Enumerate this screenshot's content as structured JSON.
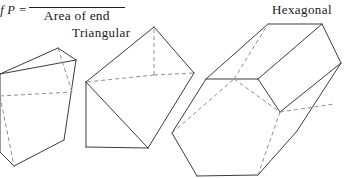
{
  "figure": {
    "background_color": "#ffffff",
    "line_color": "#3c3c3c",
    "hidden_line_color": "#8e8e8e",
    "text_color": "#1a1a1a",
    "width": 349,
    "height": 178
  },
  "formula": {
    "lhs": "h of P =",
    "numerator": "",
    "denominator": "Area of end"
  },
  "labels": {
    "triangular": "Triangular",
    "hexagonal": "Hexagonal"
  },
  "shapes": [
    {
      "name": "triangular-prism-left",
      "label": "",
      "cross_section": "triangle",
      "visible_edges": [
        [
          0,
          152,
          14,
          166
        ],
        [
          14,
          166,
          64,
          140
        ],
        [
          0,
          74,
          58,
          48
        ],
        [
          58,
          48,
          76,
          60
        ],
        [
          76,
          60,
          64,
          140
        ],
        [
          0,
          152,
          0,
          74
        ],
        [
          0,
          74,
          76,
          60
        ]
      ],
      "hidden_edges": [
        [
          0,
          96,
          72,
          92
        ],
        [
          72,
          92,
          58,
          48
        ],
        [
          0,
          96,
          14,
          166
        ]
      ]
    },
    {
      "name": "triangular-prism-middle",
      "label": "Triangular",
      "cross_section": "triangle",
      "visible_edges": [
        [
          86,
          82,
          154,
          27
        ],
        [
          154,
          27,
          194,
          73
        ],
        [
          194,
          73,
          148,
          148
        ],
        [
          148,
          148,
          86,
          147
        ],
        [
          86,
          147,
          86,
          82
        ],
        [
          86,
          82,
          148,
          148
        ]
      ],
      "hidden_edges": [
        [
          154,
          75,
          154,
          27
        ],
        [
          154,
          75,
          194,
          73
        ],
        [
          154,
          75,
          86,
          82
        ]
      ]
    },
    {
      "name": "hexagonal-prism-right",
      "label": "Hexagonal",
      "cross_section": "hexagon",
      "visible_edges": [
        [
          172,
          133,
          206,
          79
        ],
        [
          206,
          79,
          268,
          24
        ],
        [
          268,
          24,
          322,
          24
        ],
        [
          322,
          24,
          341,
          63
        ],
        [
          341,
          63,
          297,
          131
        ],
        [
          297,
          131,
          258,
          175
        ],
        [
          258,
          175,
          197,
          176
        ],
        [
          197,
          176,
          172,
          133
        ],
        [
          206,
          79,
          258,
          79
        ],
        [
          258,
          79,
          280,
          112
        ],
        [
          280,
          112,
          341,
          63
        ],
        [
          258,
          79,
          322,
          24
        ]
      ],
      "hidden_edges": [
        [
          172,
          133,
          234,
          79
        ],
        [
          234,
          79,
          268,
          24
        ],
        [
          280,
          112,
          334,
          104
        ],
        [
          258,
          175,
          280,
          112
        ],
        [
          234,
          79,
          280,
          112
        ]
      ]
    }
  ]
}
